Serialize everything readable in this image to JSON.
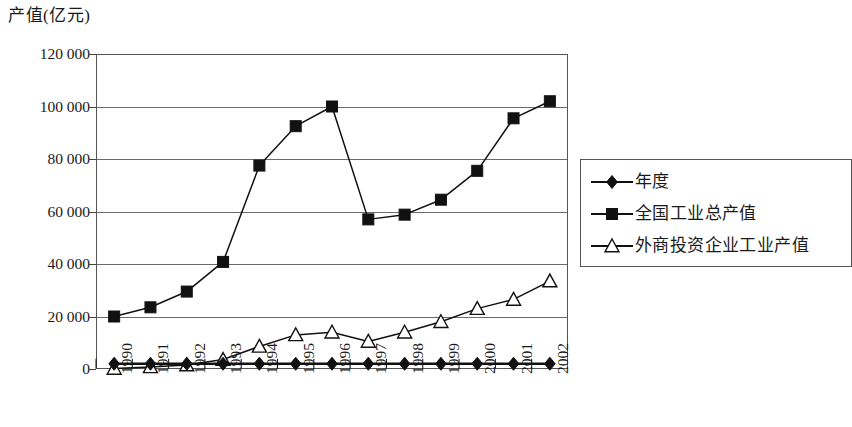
{
  "chart_data": {
    "type": "line",
    "title": "产值(亿元)",
    "xlabel": "",
    "ylabel": "产值(亿元)",
    "ylim": [
      0,
      120000
    ],
    "yticks": [
      "0",
      "20 000",
      "40 000",
      "60 000",
      "80 000",
      "100 000",
      "120 000"
    ],
    "ytick_values": [
      0,
      20000,
      40000,
      60000,
      80000,
      100000,
      120000
    ],
    "grid": true,
    "legend_position": "right",
    "categories": [
      "1990",
      "1991",
      "1992",
      "1993",
      "1994",
      "1995",
      "1996",
      "1997",
      "1998",
      "1999",
      "2000",
      "2001",
      "2002"
    ],
    "series": [
      {
        "name": "年度",
        "marker": "filled-diamond",
        "values": [
          2000,
          2000,
          2000,
          2000,
          2000,
          2000,
          2000,
          2000,
          2000,
          2000,
          2000,
          2000,
          2000
        ]
      },
      {
        "name": "全国工业总产值",
        "marker": "filled-square",
        "values": [
          20000,
          23500,
          29500,
          40800,
          77500,
          92500,
          100000,
          57000,
          58800,
          64500,
          75500,
          95500,
          102000
        ]
      },
      {
        "name": "外商投资企业工业产值",
        "marker": "open-triangle",
        "values": [
          200,
          800,
          1500,
          3600,
          8600,
          13000,
          14000,
          10500,
          14000,
          18000,
          23000,
          26500,
          33500
        ]
      }
    ]
  },
  "legend": {
    "items": [
      {
        "label": "年度",
        "marker": "filled-diamond"
      },
      {
        "label": "全国工业总产值",
        "marker": "filled-square"
      },
      {
        "label": "外商投资企业工业产值",
        "marker": "open-triangle"
      }
    ]
  }
}
